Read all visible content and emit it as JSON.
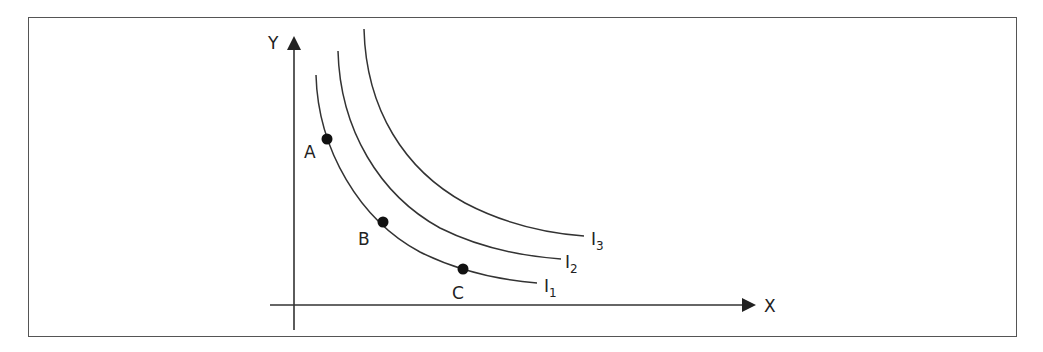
{
  "diagram": {
    "type": "indifference-curves",
    "axes": {
      "x_label": "X",
      "y_label": "Y"
    },
    "curves": [
      {
        "id": "I1",
        "label_main": "I",
        "label_sub": "1"
      },
      {
        "id": "I2",
        "label_main": "I",
        "label_sub": "2"
      },
      {
        "id": "I3",
        "label_main": "I",
        "label_sub": "3"
      }
    ],
    "points": [
      {
        "label": "A",
        "on_curve": "I1"
      },
      {
        "label": "B",
        "on_curve": "I1"
      },
      {
        "label": "C",
        "on_curve": "I1"
      }
    ],
    "colors": {
      "stroke": "#333333",
      "frame": "#555555",
      "background": "#ffffff"
    }
  }
}
